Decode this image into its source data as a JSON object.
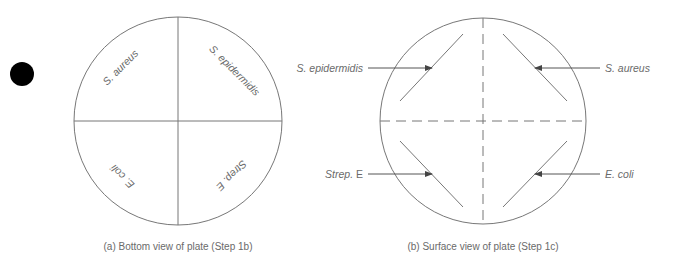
{
  "figure": {
    "marker": {
      "shape": "filled-circle",
      "color": "#000000"
    },
    "colors": {
      "line": "#777777",
      "text": "#6a6a6a"
    },
    "panel_a": {
      "caption": "(a) Bottom view of plate (Step 1b)",
      "quadrants": [
        {
          "position": "upper-left",
          "label": "S. aureus"
        },
        {
          "position": "upper-right",
          "label": "S. epidermidis"
        },
        {
          "position": "lower-left",
          "label": "E. coli"
        },
        {
          "position": "lower-right",
          "label": "Strep. E"
        }
      ]
    },
    "panel_b": {
      "caption": "(b) Surface view of plate (Step 1c)",
      "streaks": [
        {
          "position": "upper-left",
          "label_italic": "S. epidermidis",
          "label_plain": ""
        },
        {
          "position": "upper-right",
          "label_italic": "S. aureus",
          "label_plain": ""
        },
        {
          "position": "lower-left",
          "label_italic": "Strep.",
          "label_plain": " E"
        },
        {
          "position": "lower-right",
          "label_italic": "E. coli",
          "label_plain": ""
        }
      ]
    }
  }
}
